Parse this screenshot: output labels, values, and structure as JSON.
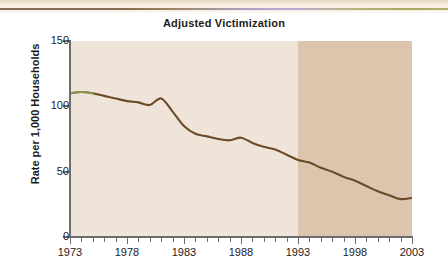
{
  "chart_data": {
    "type": "line",
    "title": "Adjusted Victimization",
    "xlabel": "",
    "ylabel": "Rate per 1,000 Households",
    "xlim": [
      1973,
      2003
    ],
    "ylim": [
      0,
      150
    ],
    "ytick_labels": [
      "150",
      "100",
      "50",
      "0"
    ],
    "ytick_values": [
      150,
      100,
      50,
      0
    ],
    "xtick_labels": [
      "1973",
      "1978",
      "1983",
      "1988",
      "1993",
      "1998",
      "2003"
    ],
    "xtick_values": [
      1973,
      1978,
      1983,
      1988,
      1993,
      1998,
      2003
    ],
    "grid": false,
    "legend": "none",
    "minor_ticks": "every year",
    "shaded_region": {
      "from": 1993,
      "to": 2003,
      "color": "#ddc4ad",
      "label": ""
    },
    "plot_background": "#f1e5d9",
    "line_color": "#6b4a28",
    "line_color_start": "#8a9c4e",
    "series": [
      {
        "name": "Adjusted victimization rate",
        "x": [
          1973,
          1974,
          1975,
          1976,
          1977,
          1978,
          1979,
          1980,
          1981,
          1982,
          1983,
          1984,
          1985,
          1986,
          1987,
          1988,
          1989,
          1990,
          1991,
          1992,
          1993,
          1994,
          1995,
          1996,
          1997,
          1998,
          1999,
          2000,
          2001,
          2002,
          2003
        ],
        "values": [
          110,
          111,
          110,
          108,
          106,
          104,
          103,
          101,
          106,
          96,
          85,
          79,
          77,
          75,
          74,
          76,
          72,
          69,
          67,
          63,
          59,
          57,
          53,
          50,
          46,
          43,
          39,
          35,
          32,
          29,
          30
        ]
      }
    ]
  },
  "meta": {
    "title_text": "Adjusted Victimization"
  }
}
